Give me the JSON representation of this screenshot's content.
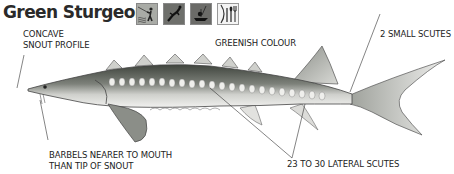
{
  "header": {
    "title": "Green Sturgeon",
    "activity_icons": [
      {
        "name": "shore-fishing-icon",
        "label": "Shore fishing"
      },
      {
        "name": "spearfishing-icon",
        "label": "Spearfishing"
      },
      {
        "name": "boat-fishing-icon",
        "label": "Boat fishing"
      },
      {
        "name": "edibility-icon",
        "label": "Edibility"
      }
    ]
  },
  "annotations": {
    "snout": {
      "line1": "CONCAVE",
      "line2": "SNOUT PROFILE"
    },
    "colour": "GREENISH COLOUR",
    "scutes_small": "2 SMALL SCUTES",
    "barbels": {
      "line1": "BARBELS NEARER TO MOUTH",
      "line2": "THAN TIP OF SNOUT"
    },
    "lateral_scutes": "23 TO 30 LATERAL SCUTES"
  },
  "colors": {
    "ink": "#222222",
    "body_dark": "#4a4f48",
    "body_mid": "#9a9d97",
    "belly": "#e8e8e6",
    "icon_dark": "#6b6b6b"
  }
}
